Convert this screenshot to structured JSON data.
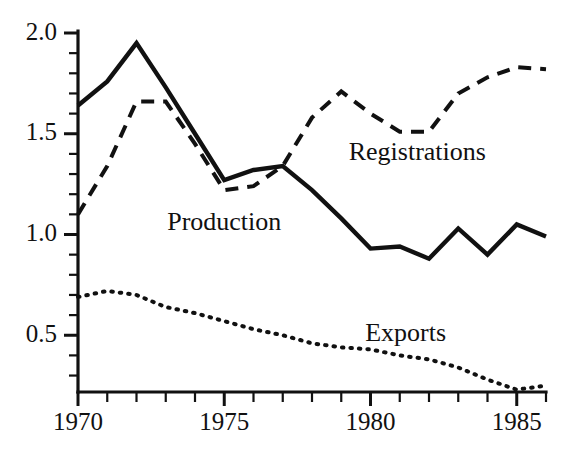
{
  "chart_data": {
    "type": "line",
    "title": "",
    "subtitle": "",
    "xlabel": "",
    "ylabel": "",
    "xlim": [
      1970,
      1986
    ],
    "ylim": [
      0.22,
      2.04
    ],
    "grid": false,
    "legend_position": "inline-annotations",
    "x_ticks_major": [
      "1970",
      "1975",
      "1980",
      "1985"
    ],
    "x_ticks_major_values": [
      1970,
      1975,
      1980,
      1985
    ],
    "x_tick_step_minor": 1,
    "y_ticks_major": [
      "2.0",
      "1.5",
      "1.0",
      "0.5"
    ],
    "y_ticks_major_values": [
      2.0,
      1.5,
      1.0,
      0.5
    ],
    "y_tick_step_minor": 0.1,
    "x": [
      1970,
      1971,
      1972,
      1973,
      1974,
      1975,
      1976,
      1977,
      1978,
      1979,
      1980,
      1981,
      1982,
      1983,
      1984,
      1985,
      1986
    ],
    "series": [
      {
        "name": "Production",
        "style": "solid",
        "label": "Production",
        "label_x": 1975.0,
        "label_y": 1.05,
        "values": [
          1.64,
          1.76,
          1.95,
          1.73,
          1.5,
          1.27,
          1.32,
          1.34,
          1.22,
          1.08,
          0.93,
          0.94,
          0.88,
          1.03,
          0.9,
          1.05,
          0.99
        ]
      },
      {
        "name": "Registrations",
        "style": "dashed",
        "label": "Registrations",
        "label_x": 1981.6,
        "label_y": 1.4,
        "values": [
          1.1,
          1.34,
          1.66,
          1.66,
          1.45,
          1.22,
          1.24,
          1.34,
          1.58,
          1.71,
          1.6,
          1.51,
          1.51,
          1.7,
          1.78,
          1.83,
          1.82
        ]
      },
      {
        "name": "Exports",
        "style": "dotted",
        "label": "Exports",
        "label_x": 1981.2,
        "label_y": 0.5,
        "values": [
          0.69,
          0.72,
          0.7,
          0.64,
          0.61,
          0.57,
          0.53,
          0.5,
          0.46,
          0.44,
          0.43,
          0.4,
          0.38,
          0.34,
          0.28,
          0.23,
          0.25
        ]
      }
    ]
  },
  "axis": {
    "y_labels": [
      "2.0",
      "1.5",
      "1.0",
      "0.5"
    ],
    "x_labels": [
      "1970",
      "1975",
      "1980",
      "1985"
    ]
  },
  "annotations": {
    "production": "Production",
    "registrations": "Registrations",
    "exports": "Exports"
  }
}
